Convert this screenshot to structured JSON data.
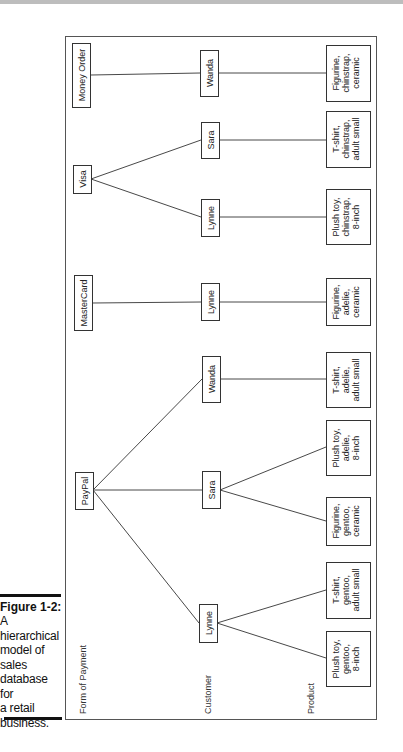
{
  "caption": {
    "title": "Figure 1-2:",
    "body_lines": [
      "A",
      "hierarchical",
      "model of",
      "sales",
      "database for",
      "a retail",
      "business."
    ]
  },
  "levels": {
    "payment": "Form of Payment",
    "customer": "Customer",
    "product": "Product"
  },
  "payments": [
    {
      "label": "Money Order"
    },
    {
      "label": "Visa"
    },
    {
      "label": "MasterCard"
    },
    {
      "label": "PayPal"
    }
  ],
  "customers": [
    {
      "label": "Wanda",
      "parent": "Money Order"
    },
    {
      "label": "Sara",
      "parent": "Visa"
    },
    {
      "label": "Lynne",
      "parent": "Visa"
    },
    {
      "label": "Lynne",
      "parent": "MasterCard"
    },
    {
      "label": "Wanda",
      "parent": "PayPal"
    },
    {
      "label": "Sara",
      "parent": "PayPal"
    },
    {
      "label": "Lynne",
      "parent": "PayPal"
    }
  ],
  "products": [
    {
      "lines": [
        "Figurine,",
        "chinstrap,",
        "ceramic"
      ]
    },
    {
      "lines": [
        "T-shirt,",
        "chinstrap,",
        "adult small"
      ]
    },
    {
      "lines": [
        "Plush toy,",
        "chinstrap,",
        "8-inch"
      ]
    },
    {
      "lines": [
        "Figurine,",
        "adelie,",
        "ceramic"
      ]
    },
    {
      "lines": [
        "T-shirt,",
        "adelie,",
        "adult small"
      ]
    },
    {
      "lines": [
        "Plush toy,",
        "adelie,",
        "8-inch"
      ]
    },
    {
      "lines": [
        "Figurine,",
        "gentoo,",
        "ceramic"
      ]
    },
    {
      "lines": [
        "T-shirt,",
        "gentoo,",
        "adult small"
      ]
    },
    {
      "lines": [
        "Plush toy,",
        "gentoo,",
        "8-inch"
      ]
    }
  ]
}
